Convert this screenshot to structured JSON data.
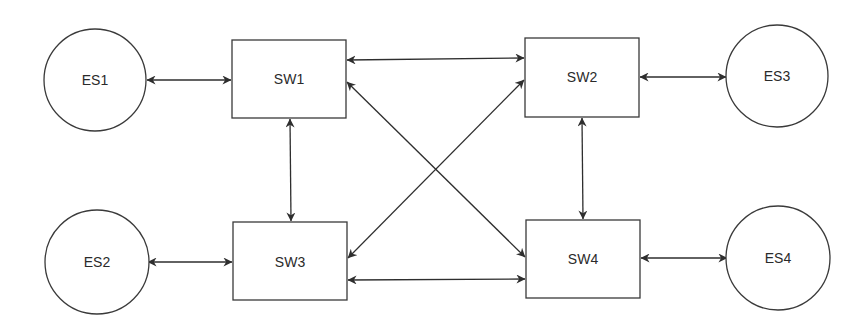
{
  "diagram": {
    "title": "",
    "nodes": {
      "es1": {
        "label": "ES1",
        "type": "end-station",
        "shape": "circle"
      },
      "es2": {
        "label": "ES2",
        "type": "end-station",
        "shape": "circle"
      },
      "es3": {
        "label": "ES3",
        "type": "end-station",
        "shape": "circle"
      },
      "es4": {
        "label": "ES4",
        "type": "end-station",
        "shape": "circle"
      },
      "sw1": {
        "label": "SW1",
        "type": "switch",
        "shape": "rectangle"
      },
      "sw2": {
        "label": "SW2",
        "type": "switch",
        "shape": "rectangle"
      },
      "sw3": {
        "label": "SW3",
        "type": "switch",
        "shape": "rectangle"
      },
      "sw4": {
        "label": "SW4",
        "type": "switch",
        "shape": "rectangle"
      }
    },
    "edges": [
      {
        "from": "ES1",
        "to": "SW1",
        "direction": "bidirectional"
      },
      {
        "from": "ES2",
        "to": "SW3",
        "direction": "bidirectional"
      },
      {
        "from": "SW2",
        "to": "ES3",
        "direction": "bidirectional"
      },
      {
        "from": "SW4",
        "to": "ES4",
        "direction": "bidirectional"
      },
      {
        "from": "SW1",
        "to": "SW2",
        "direction": "bidirectional"
      },
      {
        "from": "SW3",
        "to": "SW4",
        "direction": "bidirectional"
      },
      {
        "from": "SW1",
        "to": "SW3",
        "direction": "bidirectional"
      },
      {
        "from": "SW2",
        "to": "SW4",
        "direction": "bidirectional"
      },
      {
        "from": "SW1",
        "to": "SW4",
        "direction": "bidirectional"
      },
      {
        "from": "SW3",
        "to": "SW2",
        "direction": "bidirectional"
      }
    ],
    "colors": {
      "stroke": "#3a3a3a",
      "text": "#2a2a2a",
      "background": "#ffffff"
    }
  }
}
